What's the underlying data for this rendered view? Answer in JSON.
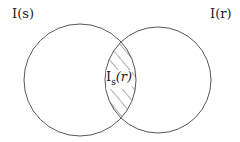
{
  "diagram": {
    "type": "venn",
    "sets": [
      {
        "label": "I(s)"
      },
      {
        "label": "I(r)"
      }
    ],
    "intersection": {
      "label_main": "I",
      "label_sub": "s",
      "label_arg": "(r)",
      "fill": "hatched"
    }
  }
}
